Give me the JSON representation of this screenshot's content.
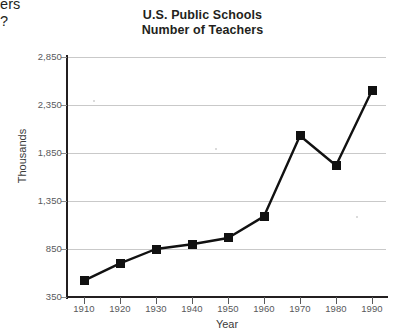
{
  "page": {
    "cropped_question_fragment": "ers\n?"
  },
  "chart_data": {
    "type": "line",
    "title": "U.S. Public Schools",
    "subtitle": "Number of Teachers",
    "xlabel": "Year",
    "ylabel": "Thousands",
    "categories": [
      "1910",
      "1920",
      "1930",
      "1940",
      "1950",
      "1960",
      "1970",
      "1980",
      "1990"
    ],
    "values": [
      520,
      700,
      850,
      900,
      965,
      1190,
      2030,
      1720,
      2500
    ],
    "ytick_labels": [
      "350",
      "850",
      "1,350",
      "1,850",
      "2,350",
      "2,850"
    ],
    "yticks": [
      350,
      850,
      1350,
      1850,
      2350,
      2850
    ],
    "ylim": [
      350,
      2850
    ],
    "xlim": [
      1905,
      1995
    ],
    "grid": "horizontal",
    "legend": "none",
    "series_color": "#111111",
    "grid_color": "#c9c9c9",
    "axis_color": "#231f20",
    "marker": "square"
  }
}
